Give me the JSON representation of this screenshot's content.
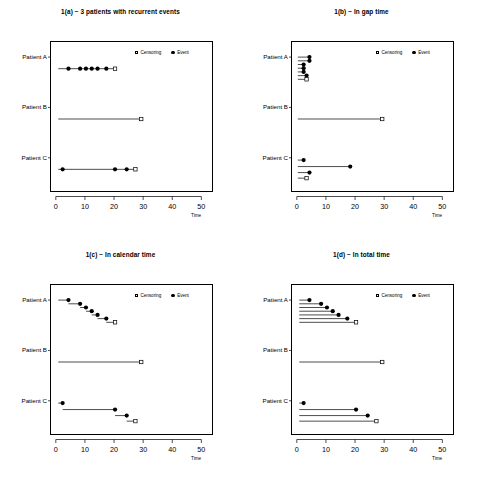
{
  "figure": {
    "width": 482,
    "height": 486,
    "background": "#ffffff",
    "foreground": "#000000"
  },
  "legend": {
    "censoring_label": "Censoring",
    "event_label": "Event",
    "censoring_symbol": "open-square",
    "event_symbol": "filled-circle"
  },
  "axis": {
    "x_label": "Time",
    "x_ticks": [
      0,
      10,
      20,
      30,
      40,
      50
    ],
    "x_tick_labels": [
      "0",
      "10",
      "20",
      "30",
      "40",
      "50"
    ],
    "x_min": -2,
    "x_max": 54,
    "subjects": [
      "Patient A",
      "Patient B",
      "Patient C"
    ]
  },
  "chart_data": [
    {
      "id": "panel-a",
      "type": "line",
      "title": "1(a) − 3 patients with recurrent events",
      "xlabel": "Time",
      "ylabel": "",
      "xlim": [
        -2,
        54
      ],
      "grid": false,
      "legend_position": "top-right",
      "subjects": [
        {
          "name": "Patient A",
          "rows": [
            {
              "y": 0.5,
              "start": 0.5,
              "end": 20,
              "events": [
                4,
                8,
                10,
                12,
                14,
                17
              ],
              "censor": 20
            }
          ]
        },
        {
          "name": "Patient B",
          "rows": [
            {
              "y": 0.5,
              "start": 0.5,
              "end": 29,
              "events": [],
              "censor": 29
            }
          ]
        },
        {
          "name": "Patient C",
          "rows": [
            {
              "y": 0.5,
              "start": 0.5,
              "end": 27,
              "events": [
                2,
                20,
                24
              ],
              "censor": 27
            }
          ]
        }
      ]
    },
    {
      "id": "panel-b",
      "type": "line",
      "title": "1(b) − In gap time",
      "xlabel": "Time",
      "ylabel": "",
      "xlim": [
        -2,
        54
      ],
      "grid": false,
      "legend_position": "top-right",
      "subjects": [
        {
          "name": "Patient A",
          "rows": [
            {
              "y": 0.0,
              "start": 0,
              "end": 4,
              "events": [
                4
              ],
              "censor": null
            },
            {
              "y": 0.16,
              "start": 0,
              "end": 4,
              "events": [
                4
              ],
              "censor": null
            },
            {
              "y": 0.32,
              "start": 0,
              "end": 2,
              "events": [
                2
              ],
              "censor": null
            },
            {
              "y": 0.48,
              "start": 0,
              "end": 2,
              "events": [
                2
              ],
              "censor": null
            },
            {
              "y": 0.64,
              "start": 0,
              "end": 2,
              "events": [
                2
              ],
              "censor": null
            },
            {
              "y": 0.8,
              "start": 0,
              "end": 3,
              "events": [
                3
              ],
              "censor": null
            },
            {
              "y": 0.96,
              "start": 0,
              "end": 3,
              "events": [],
              "censor": 3
            }
          ]
        },
        {
          "name": "Patient B",
          "rows": [
            {
              "y": 0.5,
              "start": 0,
              "end": 29,
              "events": [],
              "censor": 29
            }
          ]
        },
        {
          "name": "Patient C",
          "rows": [
            {
              "y": 0.1,
              "start": 0,
              "end": 2,
              "events": [
                2
              ],
              "censor": null
            },
            {
              "y": 0.38,
              "start": 0,
              "end": 18,
              "events": [
                18
              ],
              "censor": null
            },
            {
              "y": 0.64,
              "start": 0,
              "end": 4,
              "events": [
                4
              ],
              "censor": null
            },
            {
              "y": 0.88,
              "start": 0,
              "end": 3,
              "events": [],
              "censor": 3
            }
          ]
        }
      ]
    },
    {
      "id": "panel-c",
      "type": "line",
      "title": "1(c) − In calendar time",
      "xlabel": "Time",
      "ylabel": "",
      "xlim": [
        -2,
        54
      ],
      "grid": false,
      "legend_position": "top-right",
      "subjects": [
        {
          "name": "Patient A",
          "rows": [
            {
              "y": 0.0,
              "start": 0.5,
              "end": 4,
              "events": [
                4
              ],
              "censor": null
            },
            {
              "y": 0.16,
              "start": 4,
              "end": 8,
              "events": [
                8
              ],
              "censor": null
            },
            {
              "y": 0.32,
              "start": 8,
              "end": 10,
              "events": [
                10
              ],
              "censor": null
            },
            {
              "y": 0.48,
              "start": 10,
              "end": 12,
              "events": [
                12
              ],
              "censor": null
            },
            {
              "y": 0.64,
              "start": 12,
              "end": 14,
              "events": [
                14
              ],
              "censor": null
            },
            {
              "y": 0.8,
              "start": 14,
              "end": 17,
              "events": [
                17
              ],
              "censor": null
            },
            {
              "y": 0.96,
              "start": 17,
              "end": 20,
              "events": [],
              "censor": 20
            }
          ]
        },
        {
          "name": "Patient B",
          "rows": [
            {
              "y": 0.5,
              "start": 0.5,
              "end": 29,
              "events": [],
              "censor": 29
            }
          ]
        },
        {
          "name": "Patient C",
          "rows": [
            {
              "y": 0.1,
              "start": 0.5,
              "end": 2,
              "events": [
                2
              ],
              "censor": null
            },
            {
              "y": 0.38,
              "start": 2,
              "end": 20,
              "events": [
                20
              ],
              "censor": null
            },
            {
              "y": 0.64,
              "start": 20,
              "end": 24,
              "events": [
                24
              ],
              "censor": null
            },
            {
              "y": 0.88,
              "start": 24,
              "end": 27,
              "events": [],
              "censor": 27
            }
          ]
        }
      ]
    },
    {
      "id": "panel-d",
      "type": "line",
      "title": "1(d) − In total time",
      "xlabel": "Time",
      "ylabel": "",
      "xlim": [
        -2,
        54
      ],
      "grid": false,
      "legend_position": "top-right",
      "subjects": [
        {
          "name": "Patient A",
          "rows": [
            {
              "y": 0.0,
              "start": 0.5,
              "end": 4,
              "events": [
                4
              ],
              "censor": null
            },
            {
              "y": 0.16,
              "start": 0.5,
              "end": 8,
              "events": [
                8
              ],
              "censor": null
            },
            {
              "y": 0.32,
              "start": 0.5,
              "end": 10,
              "events": [
                10
              ],
              "censor": null
            },
            {
              "y": 0.48,
              "start": 0.5,
              "end": 12,
              "events": [
                12
              ],
              "censor": null
            },
            {
              "y": 0.64,
              "start": 0.5,
              "end": 14,
              "events": [
                14
              ],
              "censor": null
            },
            {
              "y": 0.8,
              "start": 0.5,
              "end": 17,
              "events": [
                17
              ],
              "censor": null
            },
            {
              "y": 0.96,
              "start": 0.5,
              "end": 20,
              "events": [],
              "censor": 20
            }
          ]
        },
        {
          "name": "Patient B",
          "rows": [
            {
              "y": 0.5,
              "start": 0.5,
              "end": 29,
              "events": [],
              "censor": 29
            }
          ]
        },
        {
          "name": "Patient C",
          "rows": [
            {
              "y": 0.1,
              "start": 0.5,
              "end": 2,
              "events": [
                2
              ],
              "censor": null
            },
            {
              "y": 0.38,
              "start": 0.5,
              "end": 20,
              "events": [
                20
              ],
              "censor": null
            },
            {
              "y": 0.64,
              "start": 0.5,
              "end": 24,
              "events": [
                24
              ],
              "censor": null
            },
            {
              "y": 0.88,
              "start": 0.5,
              "end": 27,
              "events": [],
              "censor": 27
            }
          ]
        }
      ]
    }
  ]
}
